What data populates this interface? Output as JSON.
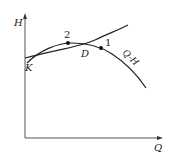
{
  "diagram": {
    "type": "pump-pipeline characteristic curves",
    "axes": {
      "y_label": "H",
      "x_label": "Q"
    },
    "curves": [
      {
        "name": "pipeline-curve",
        "label": ""
      },
      {
        "name": "pump-curve",
        "label": "Q-H"
      }
    ],
    "points": [
      {
        "id": "K",
        "label": "K",
        "marker": false
      },
      {
        "id": "2",
        "label": "2",
        "marker": true
      },
      {
        "id": "D",
        "label": "D",
        "marker": false
      },
      {
        "id": "1",
        "label": "1",
        "marker": true
      }
    ],
    "colors": {
      "line": "#222222",
      "axis": "#555555",
      "background": "#ffffff"
    }
  }
}
